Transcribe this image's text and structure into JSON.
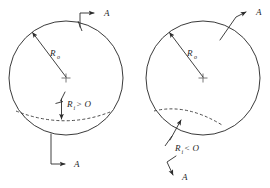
{
  "figure": {
    "background_color": "#ffffff",
    "line_color": "#2b2b2b",
    "panels": [
      {
        "id": "left",
        "name": "positive-inner-radius-panel",
        "circle": {
          "cx": 66,
          "cy": 78,
          "r": 57
        },
        "center_label": "+",
        "outer_radius": {
          "symbol": "R",
          "subscript": "o",
          "full": "Ro"
        },
        "inner_radius": {
          "symbol": "R",
          "subscript": "i",
          "relation": ">",
          "value": "O",
          "full": "Ri>O"
        },
        "axis_labels": [
          {
            "name": "axis-label-a-top",
            "text": "A"
          },
          {
            "name": "axis-label-a-bottom",
            "text": "A"
          }
        ]
      },
      {
        "id": "right",
        "name": "negative-inner-radius-panel",
        "circle": {
          "cx": 203,
          "cy": 78,
          "r": 57
        },
        "center_label": "+",
        "outer_radius": {
          "symbol": "R",
          "subscript": "o",
          "full": "Ro"
        },
        "inner_radius": {
          "symbol": "R",
          "subscript": "i",
          "relation": "<",
          "value": "O",
          "full": "Ri<O"
        },
        "axis_labels": [
          {
            "name": "axis-label-a-top",
            "text": "A"
          },
          {
            "name": "axis-label-a-bottom",
            "text": "A"
          }
        ]
      }
    ],
    "symbols": {
      "radius_symbol": "R",
      "subscript_outer": "o",
      "subscript_inner": "i",
      "greater_than": ">",
      "less_than": "<",
      "zero": "O",
      "axis_letter": "A",
      "center_cross": "+"
    }
  }
}
